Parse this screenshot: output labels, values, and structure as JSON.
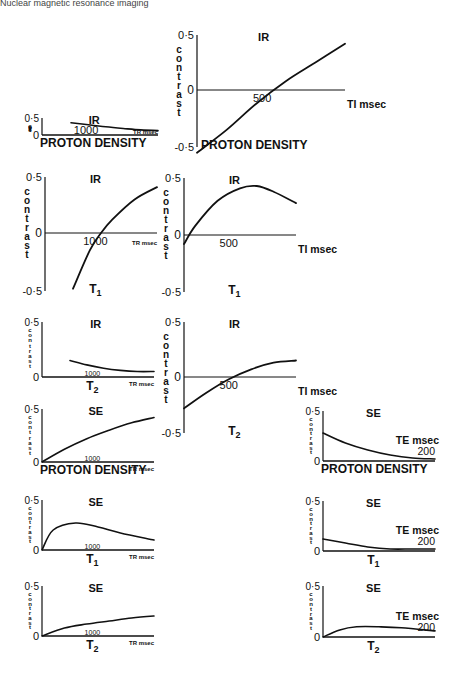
{
  "header": {
    "text": "Nuclear magnetic resonance imaging"
  },
  "colors": {
    "ink": "#111111",
    "background": "#ffffff"
  },
  "labels": {
    "contrast": "contrast",
    "y_top": "0·5",
    "y_zero": "0",
    "y_bottom": "-0·5",
    "ir": "IR",
    "se": "SE",
    "proton_density": "PROTON DENSITY",
    "t1": "T",
    "t2": "T",
    "sub1": "1",
    "sub2": "2",
    "tr_msec": "TR msec",
    "ti_msec": "TI msec",
    "te_msec": "TE msec",
    "tick_1000": "1000",
    "tick_500": "500",
    "tick_200": "200"
  },
  "chart_data": [
    {
      "id": "ir-pd-tr",
      "type": "line",
      "title": "IR",
      "subtitle": "PROTON DENSITY",
      "xlabel": "TR msec",
      "ylabel": "contrast",
      "ylim": [
        0,
        0.5
      ],
      "x_ticks": [
        "1000"
      ],
      "x": [
        0.25,
        0.4,
        0.55,
        0.7,
        0.85,
        1.0
      ],
      "values": [
        0.36,
        0.3,
        0.24,
        0.19,
        0.15,
        0.13
      ]
    },
    {
      "id": "ir-pd-ti",
      "type": "line",
      "title": "IR",
      "subtitle": "PROTON DENSITY",
      "xlabel": "TI msec",
      "ylabel": "contrast",
      "ylim": [
        -0.5,
        0.5
      ],
      "x_ticks": [
        "500"
      ],
      "x": [
        0.0,
        0.2,
        0.4,
        0.6,
        0.8,
        1.0
      ],
      "values": [
        -0.55,
        -0.35,
        -0.12,
        0.08,
        0.25,
        0.42
      ]
    },
    {
      "id": "ir-t1-tr",
      "type": "line",
      "title": "IR",
      "subtitle": "T1",
      "xlabel": "TR msec",
      "ylabel": "contrast",
      "ylim": [
        -0.5,
        0.5
      ],
      "x_ticks": [
        "1000"
      ],
      "x": [
        0.25,
        0.4,
        0.5,
        0.6,
        0.8,
        1.0
      ],
      "values": [
        -0.48,
        -0.15,
        0.0,
        0.12,
        0.3,
        0.41
      ]
    },
    {
      "id": "ir-t1-ti",
      "type": "line",
      "title": "IR",
      "subtitle": "T1",
      "xlabel": "TI msec",
      "ylabel": "contrast",
      "ylim": [
        -0.5,
        0.5
      ],
      "x_ticks": [
        "500"
      ],
      "x": [
        0.0,
        0.1,
        0.3,
        0.5,
        0.65,
        0.8,
        1.0
      ],
      "values": [
        -0.08,
        0.08,
        0.3,
        0.41,
        0.43,
        0.38,
        0.28
      ]
    },
    {
      "id": "ir-t2-tr",
      "type": "line",
      "title": "IR",
      "subtitle": "T2",
      "xlabel": "TR msec",
      "ylabel": "contrast",
      "ylim": [
        0,
        0.5
      ],
      "x_ticks": [
        "1000"
      ],
      "x": [
        0.25,
        0.4,
        0.55,
        0.7,
        0.85,
        1.0
      ],
      "values": [
        0.15,
        0.11,
        0.08,
        0.06,
        0.05,
        0.05
      ]
    },
    {
      "id": "ir-t2-ti",
      "type": "line",
      "title": "IR",
      "subtitle": "T2",
      "xlabel": "TI msec",
      "ylabel": "contrast",
      "ylim": [
        -0.5,
        0.5
      ],
      "x_ticks": [
        "500"
      ],
      "x": [
        0.0,
        0.2,
        0.4,
        0.6,
        0.8,
        1.0
      ],
      "values": [
        -0.28,
        -0.14,
        -0.02,
        0.07,
        0.13,
        0.15
      ]
    },
    {
      "id": "se-pd-tr",
      "type": "line",
      "title": "SE",
      "subtitle": "PROTON DENSITY",
      "xlabel": "TR msec",
      "ylabel": "contrast",
      "ylim": [
        0,
        0.5
      ],
      "x_ticks": [
        "1000"
      ],
      "x": [
        0.0,
        0.2,
        0.4,
        0.6,
        0.8,
        1.0
      ],
      "values": [
        0.0,
        0.12,
        0.22,
        0.3,
        0.37,
        0.42
      ]
    },
    {
      "id": "se-pd-te",
      "type": "line",
      "title": "SE",
      "subtitle": "PROTON DENSITY",
      "xlabel": "TE msec",
      "ylabel": "contrast",
      "ylim": [
        0,
        0.5
      ],
      "x_ticks": [
        "200"
      ],
      "x": [
        0.0,
        0.2,
        0.4,
        0.6,
        0.8,
        1.0
      ],
      "values": [
        0.28,
        0.18,
        0.11,
        0.06,
        0.03,
        0.02
      ]
    },
    {
      "id": "se-t1-tr",
      "type": "line",
      "title": "SE",
      "subtitle": "T1",
      "xlabel": "TR msec",
      "ylabel": "contrast",
      "ylim": [
        0,
        0.5
      ],
      "x_ticks": [
        "1000"
      ],
      "x": [
        0.0,
        0.1,
        0.3,
        0.5,
        0.7,
        1.0
      ],
      "values": [
        0.0,
        0.2,
        0.27,
        0.23,
        0.17,
        0.1
      ]
    },
    {
      "id": "se-t1-te",
      "type": "line",
      "title": "SE",
      "subtitle": "T1",
      "xlabel": "TE msec",
      "ylabel": "contrast",
      "ylim": [
        0,
        0.5
      ],
      "x_ticks": [
        "200"
      ],
      "x": [
        0.0,
        0.2,
        0.4,
        0.6,
        0.8,
        1.0
      ],
      "values": [
        0.12,
        0.08,
        0.04,
        0.02,
        0.02,
        0.02
      ]
    },
    {
      "id": "se-t2-tr",
      "type": "line",
      "title": "SE",
      "subtitle": "T2",
      "xlabel": "TR msec",
      "ylabel": "contrast",
      "ylim": [
        0,
        0.5
      ],
      "x_ticks": [
        "1000"
      ],
      "x": [
        0.0,
        0.2,
        0.4,
        0.6,
        0.8,
        1.0
      ],
      "values": [
        0.0,
        0.08,
        0.12,
        0.15,
        0.18,
        0.2
      ]
    },
    {
      "id": "se-t2-te",
      "type": "line",
      "title": "SE",
      "subtitle": "T2",
      "xlabel": "TE msec",
      "ylabel": "contrast",
      "ylim": [
        0,
        0.5
      ],
      "x_ticks": [
        "200"
      ],
      "x": [
        0.0,
        0.15,
        0.3,
        0.5,
        0.7,
        1.0
      ],
      "values": [
        0.0,
        0.07,
        0.1,
        0.1,
        0.09,
        0.06
      ]
    }
  ]
}
